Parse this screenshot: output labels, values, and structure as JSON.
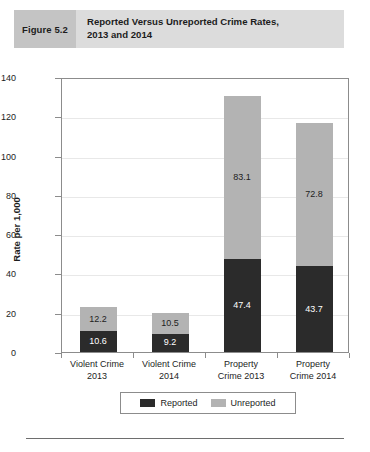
{
  "figure": {
    "number_label": "Figure 5.2",
    "title": "Reported Versus Unreported Crime Rates,\n2013 and 2014"
  },
  "chart_data": {
    "type": "bar",
    "stacked": true,
    "title": "Reported Versus Unreported Crime Rates, 2013 and 2014",
    "xlabel": "",
    "ylabel": "Rate per 1,000",
    "ylim": [
      0,
      140
    ],
    "ytick_labels": [
      "140",
      "120",
      "100",
      "80",
      "60",
      "40",
      "20",
      "0"
    ],
    "ytick_values": [
      140,
      120,
      100,
      80,
      60,
      40,
      20,
      0
    ],
    "grid": true,
    "legend_position": "bottom",
    "categories": [
      "Violent Crime\n2013",
      "Violent Crime\n2014",
      "Property\nCrime 2013",
      "Property\nCrime 2014"
    ],
    "series": [
      {
        "name": "Reported",
        "color": "#2b2b2b",
        "values": [
          10.6,
          9.2,
          47.4,
          43.7
        ],
        "labels": [
          "10.6",
          "9.2",
          "47.4",
          "43.7"
        ]
      },
      {
        "name": "Unreported",
        "color": "#b3b3b3",
        "values": [
          12.2,
          10.5,
          83.1,
          72.8
        ],
        "labels": [
          "12.2",
          "10.5",
          "83.1",
          "72.8"
        ]
      }
    ],
    "totals": [
      22.8,
      19.7,
      130.5,
      116.5
    ]
  },
  "legend": {
    "items": [
      {
        "label": "Reported",
        "color": "#2b2b2b"
      },
      {
        "label": "Unreported",
        "color": "#b3b3b3"
      }
    ]
  }
}
